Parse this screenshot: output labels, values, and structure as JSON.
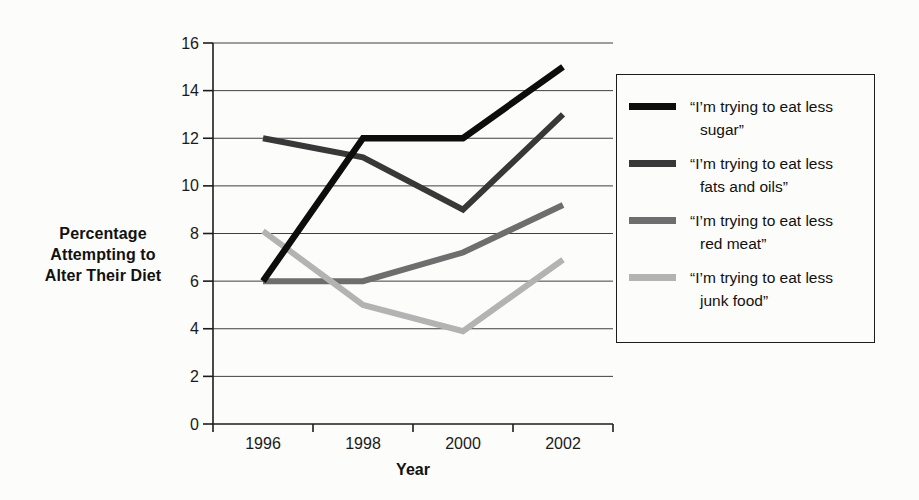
{
  "figure": {
    "background_color": "#fcfcfa",
    "text_color": "#111111",
    "gridline_color": "#3f3f3f",
    "axis_color": "#1c1c1c"
  },
  "chart_data": {
    "type": "line",
    "title": "",
    "categories": [
      "1996",
      "1998",
      "2000",
      "2002"
    ],
    "series": [
      {
        "key": "sugar",
        "name": "“I’m trying to eat less sugar”",
        "label_lines": [
          "“I’m trying to eat less",
          "sugar”"
        ],
        "values": [
          6,
          12,
          12,
          15
        ],
        "color": "#0d0d0d",
        "stroke_width": 6.5
      },
      {
        "key": "fats-and-oils",
        "name": "“I’m trying to eat less fats and oils”",
        "label_lines": [
          "“I’m trying to eat less",
          "fats and oils”"
        ],
        "values": [
          12,
          11.2,
          9,
          13
        ],
        "color": "#383838",
        "stroke_width": 6
      },
      {
        "key": "red-meat",
        "name": "“I’m trying to eat less red meat”",
        "label_lines": [
          "“I’m trying to eat less",
          "red meat”"
        ],
        "values": [
          6,
          6,
          7.2,
          9.2
        ],
        "color": "#6e6e6e",
        "stroke_width": 6
      },
      {
        "key": "junk-food",
        "name": "“I’m trying to eat less junk food”",
        "label_lines": [
          "“I’m trying to eat less",
          "junk food”"
        ],
        "values": [
          8.1,
          5,
          3.9,
          6.9
        ],
        "color": "#b3b3b3",
        "stroke_width": 6
      }
    ],
    "xlabel": "Year",
    "ylabel": "Percentage Attempting to Alter Their Diet",
    "ylabel_lines": [
      "Percentage",
      "Attempting to",
      "Alter Their Diet"
    ],
    "ylim": [
      0,
      16
    ],
    "ytick_step": 2,
    "ytick_labels": [
      "0",
      "2",
      "4",
      "6",
      "8",
      "10",
      "12",
      "14",
      "16"
    ],
    "grid": "horizontal",
    "legend_position": "right"
  }
}
